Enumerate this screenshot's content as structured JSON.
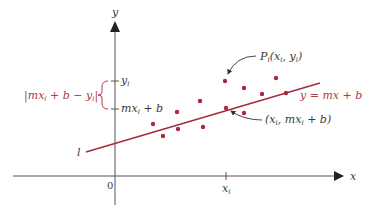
{
  "diagram": {
    "type": "least-squares-regression",
    "colors": {
      "axis": "#555555",
      "line": "#a8283c",
      "points": "#a8283c",
      "label_dark": "#3a3a3a",
      "label_red": "#b23a48"
    },
    "axes": {
      "x_label": "x",
      "y_label": "y",
      "origin_label": "0",
      "x_tick_label": "x",
      "x_tick_sub": "i",
      "y_tick_top": "y",
      "y_tick_top_sub": "i",
      "y_tick_bottom": "mx",
      "y_tick_bottom_sub": "i",
      "y_tick_bottom_rest": " + b"
    },
    "line": {
      "name_label": "l",
      "equation_label": "y = mx + b"
    },
    "brace_label": {
      "open": "|mx",
      "sub1": "i",
      "mid": " + b − y",
      "sub2": "i",
      "close": "|"
    },
    "annotation_point": {
      "prefix": "P",
      "sub": "i",
      "coords_open": "(x",
      "coords_sub1": "i",
      "coords_mid": ", y",
      "coords_sub2": "i",
      "coords_close": ")"
    },
    "annotation_line_point": {
      "open": "(x",
      "sub1": "i",
      "mid": ", mx",
      "sub2": "i",
      "close": " + b)"
    },
    "points": [
      {
        "x": 153,
        "y": 124
      },
      {
        "x": 163,
        "y": 136
      },
      {
        "x": 177,
        "y": 112
      },
      {
        "x": 178,
        "y": 129
      },
      {
        "x": 200,
        "y": 101
      },
      {
        "x": 203,
        "y": 127
      },
      {
        "x": 225,
        "y": 81
      },
      {
        "x": 244,
        "y": 88
      },
      {
        "x": 244,
        "y": 113
      },
      {
        "x": 262,
        "y": 94
      },
      {
        "x": 276,
        "y": 78
      },
      {
        "x": 286,
        "y": 93
      }
    ],
    "line_point": {
      "x": 226,
      "y": 108
    }
  }
}
